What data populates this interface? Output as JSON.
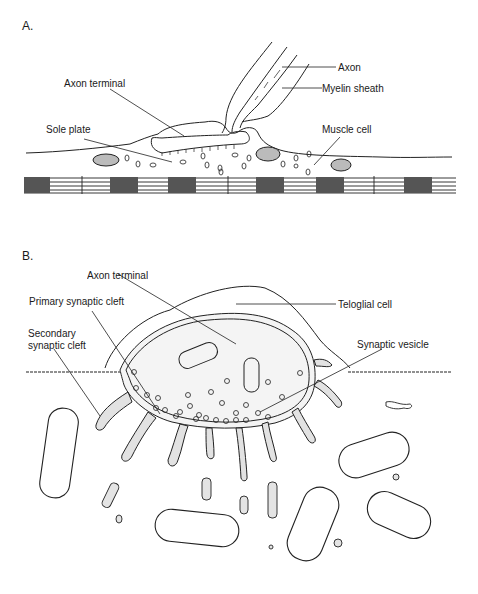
{
  "figure": {
    "panel_a": {
      "label": "A.",
      "annotations": [
        {
          "id": "axon",
          "text": "Axon"
        },
        {
          "id": "myelin-sheath",
          "text": "Myelin sheath"
        },
        {
          "id": "axon-terminal",
          "text": "Axon terminal"
        },
        {
          "id": "sole-plate",
          "text": "Sole plate"
        },
        {
          "id": "muscle-cell",
          "text": "Muscle cell"
        }
      ]
    },
    "panel_b": {
      "label": "B.",
      "annotations": [
        {
          "id": "axon-terminal",
          "text": "Axon terminal"
        },
        {
          "id": "primary-synaptic-cleft",
          "text": "Primary synaptic cleft"
        },
        {
          "id": "teloglial-cell",
          "text": "Teloglial cell"
        },
        {
          "id": "secondary-synaptic-cleft",
          "text": "Secondary synaptic cleft",
          "lines": [
            "Secondary",
            "synaptic cleft"
          ]
        },
        {
          "id": "synaptic-vesicle",
          "text": "Synaptic vesicle"
        }
      ]
    }
  }
}
